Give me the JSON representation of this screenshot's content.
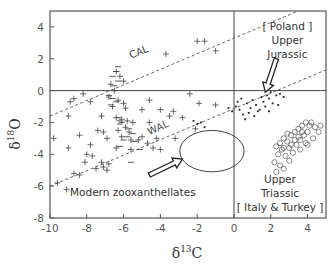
{
  "chart_data": {
    "type": "scatter",
    "title": "",
    "xlabel": "δ13C",
    "ylabel": "δ18O",
    "xlabel_parts": {
      "base": "δ",
      "sup": "13",
      "tail": "C"
    },
    "ylabel_parts": {
      "base": "δ",
      "sup": "18",
      "tail": "O"
    },
    "xlim": [
      -10,
      5
    ],
    "ylim": [
      -8,
      5
    ],
    "xticks": [
      -10,
      -8,
      -6,
      -4,
      -2,
      0,
      2,
      4
    ],
    "yticks": [
      -8,
      -6,
      -4,
      -2,
      0,
      2,
      4
    ],
    "grid": false,
    "reference_lines": [
      {
        "name": "zero-x",
        "x": 0
      },
      {
        "name": "zero-y",
        "y": 0
      }
    ],
    "trend_lines": [
      {
        "label": "CAL",
        "style": "dashed",
        "points": [
          [
            -10,
            -1.6
          ],
          [
            3.9,
            5.2
          ]
        ]
      },
      {
        "label": "WAL",
        "style": "dashed",
        "points": [
          [
            -10,
            -6.0
          ],
          [
            5.0,
            1.3
          ]
        ]
      }
    ],
    "series": [
      {
        "name": "Scleractinian corals (plus markers)",
        "marker": "plus",
        "points": [
          [
            -2.0,
            3.1
          ],
          [
            -1.6,
            3.1
          ],
          [
            -1.0,
            2.5
          ],
          [
            -3.7,
            2.3
          ],
          [
            -6.4,
            1.2
          ],
          [
            -6.2,
            0.9
          ],
          [
            -6.0,
            0.6
          ],
          [
            -6.7,
            0.4
          ],
          [
            -6.5,
            0.0
          ],
          [
            -8.7,
            -0.5
          ],
          [
            -8.9,
            -0.7
          ],
          [
            -6.8,
            -0.4
          ],
          [
            -6.3,
            -0.6
          ],
          [
            -6.0,
            -0.8
          ],
          [
            -6.6,
            -1.0
          ],
          [
            -5.9,
            -1.1
          ],
          [
            -5.0,
            -1.2
          ],
          [
            -4.0,
            -1.2
          ],
          [
            -3.3,
            -1.3
          ],
          [
            -7.2,
            -1.6
          ],
          [
            -6.4,
            -1.7
          ],
          [
            -6.1,
            -1.8
          ],
          [
            -5.8,
            -1.9
          ],
          [
            -5.5,
            -2.0
          ],
          [
            -4.6,
            -2.0
          ],
          [
            -5.9,
            -2.3
          ],
          [
            -6.3,
            -2.5
          ],
          [
            -5.7,
            -2.6
          ],
          [
            -2.1,
            -2.4
          ],
          [
            -7.4,
            -2.5
          ],
          [
            -7.1,
            -2.6
          ],
          [
            -9.0,
            -1.6
          ],
          [
            -9.8,
            -3.0
          ],
          [
            -8.4,
            -2.8
          ],
          [
            -6.1,
            -2.9
          ],
          [
            -5.6,
            -3.1
          ],
          [
            -5.2,
            -3.1
          ],
          [
            -4.7,
            -3.3
          ],
          [
            -6.9,
            -3.0
          ],
          [
            -9.0,
            -3.6
          ],
          [
            -7.8,
            -3.4
          ],
          [
            -6.4,
            -3.6
          ],
          [
            -5.6,
            -3.7
          ],
          [
            -4.4,
            -3.6
          ],
          [
            -4.0,
            -3.7
          ],
          [
            -8.0,
            -4.0
          ],
          [
            -7.7,
            -4.1
          ],
          [
            -8.1,
            -4.5
          ],
          [
            -7.2,
            -4.5
          ],
          [
            -6.8,
            -4.6
          ],
          [
            -8.7,
            -5.2
          ],
          [
            -8.4,
            -5.3
          ],
          [
            -7.5,
            -4.9
          ],
          [
            -7.1,
            -4.8
          ],
          [
            -6.9,
            -5.0
          ],
          [
            -9.6,
            -5.8
          ],
          [
            -9.1,
            -6.2
          ],
          [
            -5.0,
            -2.9
          ],
          [
            -4.2,
            -3.0
          ],
          [
            -3.2,
            -3.0
          ],
          [
            -1.9,
            -0.8
          ],
          [
            -2.4,
            -0.2
          ],
          [
            -7.8,
            -0.7
          ],
          [
            -8.2,
            -0.2
          ],
          [
            -2.8,
            -1.7
          ],
          [
            -3.5,
            -1.6
          ],
          [
            -4.6,
            -0.6
          ],
          [
            -1.0,
            -0.9
          ]
        ],
        "dash_markers": [
          [
            -6.3,
            1.5
          ],
          [
            -6.4,
            1.2
          ],
          [
            -6.6,
            0.9
          ],
          [
            -6.3,
            0.6
          ],
          [
            -6.5,
            0.3
          ],
          [
            -6.8,
            -0.3
          ],
          [
            -6.6,
            -0.5
          ],
          [
            -6.4,
            -0.7
          ],
          [
            -6.7,
            -0.9
          ],
          [
            -6.3,
            -1.7
          ],
          [
            -6.2,
            -1.9
          ],
          [
            -6.1,
            -2.0
          ],
          [
            -6.2,
            -2.1
          ],
          [
            -5.7,
            -2.4
          ],
          [
            -5.5,
            -2.7
          ],
          [
            -5.8,
            -2.9
          ],
          [
            -6.0,
            -3.1
          ],
          [
            -5.1,
            -3.7
          ],
          [
            -5.4,
            -3.2
          ],
          [
            -5.6,
            -4.5
          ],
          [
            -6.2,
            -3.5
          ]
        ]
      },
      {
        "name": "Upper Jurassic (Poland) - small dots",
        "marker": "dot",
        "points": [
          [
            -2.2,
            -1.9
          ],
          [
            -2.0,
            -2.1
          ],
          [
            -1.8,
            -2.0
          ],
          [
            -1.6,
            -2.3
          ],
          [
            -0.3,
            -1.1
          ],
          [
            -0.1,
            -1.3
          ],
          [
            0.1,
            -1.0
          ],
          [
            0.3,
            -1.2
          ],
          [
            0.5,
            -1.5
          ],
          [
            0.7,
            -0.8
          ],
          [
            0.9,
            -1.1
          ],
          [
            1.0,
            -0.6
          ],
          [
            1.2,
            -0.9
          ],
          [
            1.4,
            -1.2
          ],
          [
            1.6,
            -0.7
          ],
          [
            1.7,
            -1.0
          ],
          [
            1.9,
            -0.5
          ],
          [
            2.1,
            -0.8
          ],
          [
            2.3,
            -0.3
          ],
          [
            0.4,
            -0.5
          ],
          [
            0.8,
            -1.4
          ],
          [
            1.1,
            -1.6
          ],
          [
            1.3,
            -1.3
          ],
          [
            1.5,
            -0.4
          ],
          [
            0.6,
            -1.8
          ],
          [
            0.2,
            -0.7
          ],
          [
            1.8,
            -0.3
          ],
          [
            2.0,
            -0.1
          ],
          [
            2.5,
            -0.2
          ],
          [
            2.7,
            -0.4
          ],
          [
            2.4,
            -0.9
          ],
          [
            1.9,
            -1.3
          ]
        ]
      },
      {
        "name": "Upper Triassic (Italy & Turkey) - open circles",
        "marker": "circle",
        "points": [
          [
            2.3,
            -3.5
          ],
          [
            2.5,
            -3.3
          ],
          [
            2.7,
            -3.0
          ],
          [
            2.9,
            -3.2
          ],
          [
            3.1,
            -2.8
          ],
          [
            3.3,
            -2.6
          ],
          [
            3.5,
            -2.4
          ],
          [
            3.7,
            -2.2
          ],
          [
            3.9,
            -2.0
          ],
          [
            4.1,
            -2.2
          ],
          [
            4.4,
            -2.3
          ],
          [
            4.7,
            -2.2
          ],
          [
            3.0,
            -3.6
          ],
          [
            2.6,
            -3.7
          ],
          [
            2.4,
            -4.0
          ],
          [
            2.8,
            -4.1
          ],
          [
            3.2,
            -3.9
          ],
          [
            3.4,
            -3.4
          ],
          [
            3.6,
            -3.1
          ],
          [
            3.8,
            -2.8
          ],
          [
            4.0,
            -2.6
          ],
          [
            3.9,
            -3.3
          ],
          [
            3.5,
            -2.9
          ],
          [
            3.3,
            -3.1
          ],
          [
            2.9,
            -2.7
          ],
          [
            2.2,
            -4.5
          ],
          [
            2.5,
            -4.7
          ],
          [
            2.3,
            -5.1
          ],
          [
            2.7,
            -4.9
          ],
          [
            3.0,
            -4.4
          ],
          [
            4.6,
            -2.6
          ],
          [
            4.2,
            -2.0
          ],
          [
            3.7,
            -2.6
          ],
          [
            3.1,
            -3.4
          ],
          [
            2.7,
            -3.6
          ],
          [
            4.3,
            -3.0
          ],
          [
            3.6,
            -3.7
          ],
          [
            4.0,
            -3.4
          ]
        ]
      }
    ],
    "shapes": [
      {
        "type": "ellipse",
        "name": "Modern zooxanthellates field",
        "center": [
          -1.2,
          -3.8
        ],
        "rx_units": 1.75,
        "ry_units": 1.3
      }
    ],
    "annotations": [
      {
        "text_lines": [
          "[ Poland ]",
          "Upper",
          "Jurassic"
        ],
        "anchor": [
          2.9,
          3.8
        ]
      },
      {
        "text_lines": [
          "Upper",
          "Triassic",
          "[ Italy & Turkey ]"
        ],
        "anchor": [
          2.5,
          -5.8
        ]
      },
      {
        "text_lines": [
          "Modern zooxanthellates"
        ],
        "anchor": [
          -5.5,
          -6.6
        ]
      }
    ],
    "arrows": [
      {
        "name": "jurassic-arrow",
        "from": [
          2.3,
          2.0
        ],
        "to": [
          1.7,
          -0.1
        ]
      },
      {
        "name": "zooxanthellate-arrow",
        "from": [
          -4.6,
          -5.3
        ],
        "to": [
          -2.8,
          -4.3
        ]
      }
    ]
  }
}
